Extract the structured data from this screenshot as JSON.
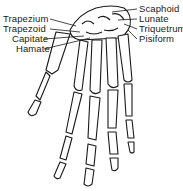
{
  "diagram": {
    "labels_left": [
      {
        "text": "Trapezium",
        "x": 3,
        "y": 14
      },
      {
        "text": "Trapezoid",
        "x": 3,
        "y": 24
      },
      {
        "text": "Capitate",
        "x": 12,
        "y": 34
      },
      {
        "text": "Hamate",
        "x": 16,
        "y": 44
      }
    ],
    "labels_right": [
      {
        "text": "Scaphoid",
        "x": 139,
        "y": 4
      },
      {
        "text": "Lunate",
        "x": 139,
        "y": 14
      },
      {
        "text": "Triquetrum",
        "x": 139,
        "y": 24
      },
      {
        "text": "Pisiform",
        "x": 139,
        "y": 34
      }
    ],
    "metacarpal_numerals": [
      "I",
      "II",
      "III",
      "IV",
      "V"
    ],
    "colors": {
      "ink": "#1a1a1a",
      "background": "#ffffff"
    }
  }
}
